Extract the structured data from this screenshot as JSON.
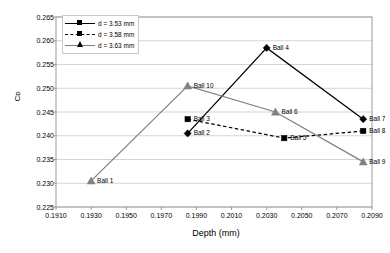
{
  "chart_data": {
    "type": "line",
    "title": "",
    "xlabel": "Depth (mm)",
    "ylabel": "Cᴅ",
    "xlim": [
      0.191,
      0.209
    ],
    "ylim": [
      0.225,
      0.265
    ],
    "xticks": [
      "0.1910",
      "0.1930",
      "0.1950",
      "0.1970",
      "0.1990",
      "0.2010",
      "0.2030",
      "0.2050",
      "0.2070",
      "0.2090"
    ],
    "xtick_values": [
      0.191,
      0.193,
      0.195,
      0.197,
      0.199,
      0.201,
      0.203,
      0.205,
      0.207,
      0.209
    ],
    "yticks": [
      "0.225",
      "0.230",
      "0.235",
      "0.240",
      "0.245",
      "0.250",
      "0.255",
      "0.260",
      "0.265"
    ],
    "ytick_values": [
      0.225,
      0.23,
      0.235,
      0.24,
      0.245,
      0.25,
      0.255,
      0.26,
      0.265
    ],
    "grid": true,
    "grid_axis": "y",
    "legend_position": "top-left",
    "series": [
      {
        "name": "d = 3.53 mm",
        "marker": "diamond",
        "linestyle": "solid",
        "color": "#000000",
        "points": [
          {
            "label": "Ball 2",
            "x": 0.1985,
            "y": 0.2405
          },
          {
            "label": "Ball 4",
            "x": 0.203,
            "y": 0.2585
          },
          {
            "label": "Ball 7",
            "x": 0.2085,
            "y": 0.2435
          }
        ]
      },
      {
        "name": "d = 3.58 mm",
        "marker": "square",
        "linestyle": "dashed",
        "color": "#000000",
        "points": [
          {
            "label": "Ball 3",
            "x": 0.1985,
            "y": 0.2435
          },
          {
            "label": "Ball 5",
            "x": 0.204,
            "y": 0.2395
          },
          {
            "label": "Ball 8",
            "x": 0.2085,
            "y": 0.241
          }
        ]
      },
      {
        "name": "d = 3.63 mm",
        "marker": "triangle",
        "linestyle": "solid",
        "color": "#808080",
        "points": [
          {
            "label": "Ball 1",
            "x": 0.193,
            "y": 0.2305
          },
          {
            "label": "Ball 10",
            "x": 0.1985,
            "y": 0.2505
          },
          {
            "label": "Ball 6",
            "x": 0.2035,
            "y": 0.245
          },
          {
            "label": "Ball 9",
            "x": 0.2085,
            "y": 0.2345
          }
        ]
      }
    ]
  }
}
